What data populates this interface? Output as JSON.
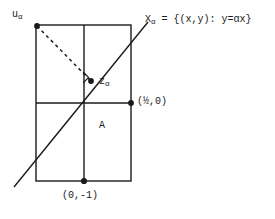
{
  "figure": {
    "type": "geometric-diagram",
    "background_color": "#ffffff",
    "stroke_color": "#1a1a1a",
    "labels": {
      "u_alpha": {
        "base": "u",
        "sub": "α",
        "x": 12,
        "y": 9
      },
      "X_alpha_set": {
        "base": "X",
        "sub": "α",
        "rest": " = {(x,y): y=αx}",
        "x": 145,
        "y": 14
      },
      "z_alpha": {
        "base": "z",
        "sub": "α",
        "x": 99,
        "y": 76
      },
      "point_half_zero": {
        "text": "(½,0)",
        "x": 137,
        "y": 96
      },
      "region_A": {
        "text": "A",
        "x": 99,
        "y": 120
      },
      "point_zero_neg_one": {
        "text": "(0,-1)",
        "x": 62,
        "y": 190
      }
    },
    "geometry": {
      "rectangle": {
        "x1": 36,
        "y1": 25,
        "x2": 131,
        "y2": 181
      },
      "vertical_center_line": {
        "x": 84,
        "y1": 25,
        "y2": 181
      },
      "horizontal_mid_line": {
        "x1": 36,
        "y1": 103,
        "x2": 131,
        "y2": 103
      },
      "diagonal_line": {
        "x1": 14,
        "y1": 187,
        "x2": 148,
        "y2": 22
      },
      "dashed_perpendicular": {
        "x1": 37,
        "y1": 26,
        "x2": 90,
        "y2": 80
      },
      "right_angle_marker": {
        "x": 91,
        "y": 81,
        "size": 8
      },
      "dots": [
        {
          "name": "u-alpha-point",
          "x": 37,
          "y": 26
        },
        {
          "name": "z-alpha-point",
          "x": 91,
          "y": 81
        },
        {
          "name": "half-zero-point",
          "x": 131,
          "y": 103
        },
        {
          "name": "zero-neg-one-point",
          "x": 84,
          "y": 181
        }
      ]
    }
  }
}
